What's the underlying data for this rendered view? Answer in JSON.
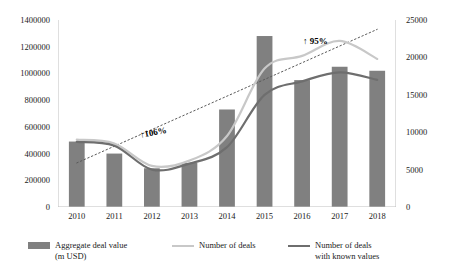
{
  "chart_data": {
    "type": "bar",
    "title": "",
    "subtitle": "",
    "xlabel": "",
    "ylabel": "",
    "categories": [
      "2010",
      "2011",
      "2012",
      "2013",
      "2014",
      "2015",
      "2016",
      "2017",
      "2018"
    ],
    "grid": false,
    "legend_position": "bottom",
    "axes": {
      "left": {
        "min": 0,
        "max": 1400000,
        "step": 200000,
        "ticks": [
          "0",
          "200000",
          "400000",
          "600000",
          "800000",
          "1000000",
          "1200000",
          "1400000"
        ],
        "tick_values": [
          0,
          200000,
          400000,
          600000,
          800000,
          1000000,
          1200000,
          1400000
        ]
      },
      "right": {
        "min": 0,
        "max": 25000,
        "step": 5000,
        "ticks": [
          "0",
          "5000",
          "10000",
          "15000",
          "20000",
          "25000"
        ],
        "tick_values": [
          0,
          5000,
          10000,
          15000,
          20000,
          25000
        ]
      }
    },
    "series": [
      {
        "name": "Aggregate deal value\n(m USD)",
        "type": "bar",
        "axis": "left",
        "color": "#808080",
        "values": [
          490000,
          400000,
          290000,
          330000,
          730000,
          1280000,
          950000,
          1050000,
          1020000
        ]
      },
      {
        "name": "Number of deals",
        "type": "line",
        "axis": "right",
        "color": "#c8c8c8",
        "values": [
          9000,
          8500,
          5500,
          6200,
          9500,
          18500,
          20200,
          22200,
          19800
        ]
      },
      {
        "name": "Number of deals\nwith known values",
        "type": "line",
        "axis": "right",
        "color": "#6e6e6e",
        "values": [
          8700,
          8200,
          5000,
          5800,
          8000,
          15000,
          16800,
          18000,
          17000
        ]
      }
    ],
    "trendlines": [
      {
        "name": "aggregate-deal-value-trend",
        "style": "dotted",
        "color": "#595959",
        "from": {
          "x_index": 0,
          "y_left": 330000
        },
        "to": {
          "x_index": 8,
          "y_left": 1330000
        }
      }
    ],
    "annotations": [
      {
        "text": "↑106%",
        "target": "aggregate-deal-value-trend"
      },
      {
        "text": "↑ 95%",
        "target": "number-of-deals"
      }
    ]
  },
  "legend": {
    "items": [
      {
        "label": "Aggregate deal value\n(m USD)",
        "marker": "bar",
        "color": "#808080"
      },
      {
        "label": "Number of deals",
        "marker": "line",
        "color": "#c8c8c8"
      },
      {
        "label": "Number of deals\nwith known values",
        "marker": "line",
        "color": "#6e6e6e"
      }
    ]
  }
}
